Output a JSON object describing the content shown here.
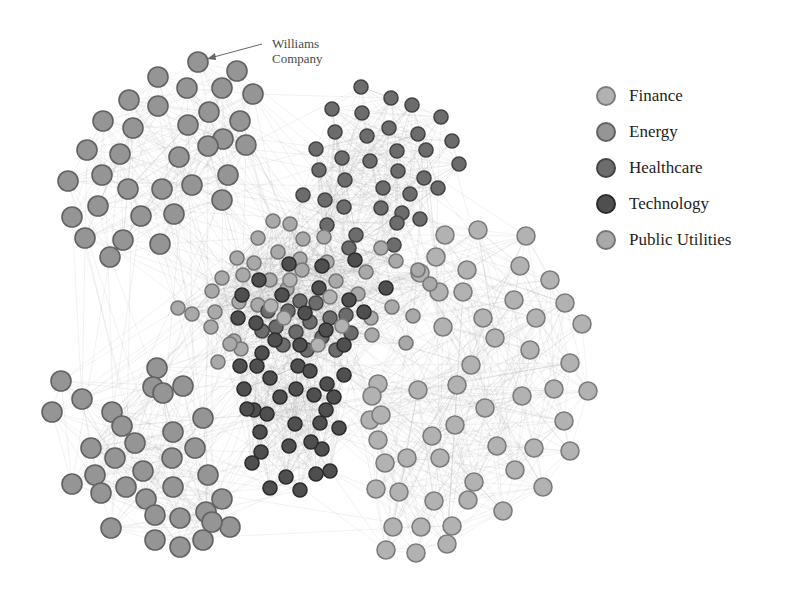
{
  "diagram": {
    "type": "network"
  },
  "annotation": {
    "line1": "Williams",
    "line2": "Company",
    "target_node": [
      198,
      62
    ],
    "arrow_from": [
      262,
      44
    ]
  },
  "legend": [
    {
      "label": "Finance",
      "color": "#b2b2b2",
      "stroke": "#7c7c7c"
    },
    {
      "label": "Energy",
      "color": "#959595",
      "stroke": "#626262"
    },
    {
      "label": "Healthcare",
      "color": "#6c6c6c",
      "stroke": "#444444"
    },
    {
      "label": "Technology",
      "color": "#4f4f4f",
      "stroke": "#2c2c2c"
    },
    {
      "label": "Public Utilities",
      "color": "#a9a9a9",
      "stroke": "#767676"
    }
  ],
  "clusters": [
    {
      "name": "Energy-top-left",
      "sector": 1,
      "r": 10,
      "nodes": [
        [
          198,
          62
        ],
        [
          237,
          71
        ],
        [
          158,
          77
        ],
        [
          253,
          94
        ],
        [
          187,
          88
        ],
        [
          222,
          88
        ],
        [
          129,
          100
        ],
        [
          158,
          106
        ],
        [
          209,
          112
        ],
        [
          240,
          121
        ],
        [
          103,
          121
        ],
        [
          133,
          128
        ],
        [
          188,
          125
        ],
        [
          223,
          139
        ],
        [
          87,
          150
        ],
        [
          120,
          154
        ],
        [
          179,
          157
        ],
        [
          208,
          146
        ],
        [
          246,
          145
        ],
        [
          68,
          181
        ],
        [
          102,
          175
        ],
        [
          128,
          189
        ],
        [
          162,
          189
        ],
        [
          192,
          185
        ],
        [
          228,
          175
        ],
        [
          72,
          217
        ],
        [
          98,
          206
        ],
        [
          141,
          216
        ],
        [
          174,
          214
        ],
        [
          222,
          200
        ],
        [
          85,
          238
        ],
        [
          123,
          240
        ],
        [
          160,
          244
        ],
        [
          110,
          257
        ]
      ]
    },
    {
      "name": "Healthcare-top",
      "sector": 2,
      "r": 7,
      "nodes": [
        [
          361,
          87
        ],
        [
          391,
          98
        ],
        [
          412,
          105
        ],
        [
          441,
          117
        ],
        [
          332,
          109
        ],
        [
          362,
          113
        ],
        [
          389,
          128
        ],
        [
          418,
          134
        ],
        [
          452,
          141
        ],
        [
          335,
          132
        ],
        [
          367,
          136
        ],
        [
          397,
          151
        ],
        [
          426,
          150
        ],
        [
          459,
          164
        ],
        [
          316,
          149
        ],
        [
          342,
          158
        ],
        [
          370,
          161
        ],
        [
          398,
          171
        ],
        [
          424,
          178
        ],
        [
          319,
          170
        ],
        [
          345,
          180
        ],
        [
          383,
          188
        ],
        [
          410,
          194
        ],
        [
          438,
          188
        ],
        [
          303,
          195
        ],
        [
          325,
          200
        ],
        [
          344,
          207
        ],
        [
          381,
          208
        ],
        [
          402,
          213
        ],
        [
          327,
          225
        ],
        [
          356,
          235
        ],
        [
          397,
          223
        ],
        [
          420,
          219
        ],
        [
          394,
          245
        ],
        [
          349,
          248
        ]
      ]
    },
    {
      "name": "Finance-right",
      "sector": 0,
      "r": 9,
      "nodes": [
        [
          445,
          235
        ],
        [
          478,
          230
        ],
        [
          526,
          236
        ],
        [
          436,
          257
        ],
        [
          420,
          273
        ],
        [
          467,
          270
        ],
        [
          520,
          266
        ],
        [
          550,
          280
        ],
        [
          439,
          292
        ],
        [
          463,
          292
        ],
        [
          514,
          300
        ],
        [
          565,
          303
        ],
        [
          483,
          318
        ],
        [
          536,
          318
        ],
        [
          582,
          324
        ],
        [
          443,
          327
        ],
        [
          495,
          338
        ],
        [
          530,
          350
        ],
        [
          570,
          363
        ],
        [
          471,
          365
        ],
        [
          554,
          389
        ],
        [
          588,
          391
        ],
        [
          457,
          385
        ],
        [
          485,
          408
        ],
        [
          522,
          396
        ],
        [
          564,
          421
        ],
        [
          570,
          451
        ],
        [
          497,
          446
        ],
        [
          534,
          448
        ],
        [
          455,
          425
        ],
        [
          440,
          458
        ],
        [
          474,
          482
        ],
        [
          515,
          470
        ],
        [
          543,
          487
        ],
        [
          407,
          458
        ],
        [
          434,
          501
        ],
        [
          468,
          500
        ],
        [
          503,
          511
        ],
        [
          447,
          544
        ],
        [
          378,
          384
        ],
        [
          418,
          390
        ],
        [
          432,
          436
        ],
        [
          385,
          463
        ],
        [
          393,
          527
        ],
        [
          421,
          527
        ],
        [
          452,
          526
        ],
        [
          416,
          553
        ],
        [
          372,
          396
        ],
        [
          370,
          420
        ],
        [
          381,
          415
        ],
        [
          378,
          440
        ],
        [
          376,
          489
        ],
        [
          399,
          492
        ],
        [
          386,
          550
        ]
      ]
    },
    {
      "name": "Energy-bottom-left",
      "sector": 1,
      "r": 10,
      "nodes": [
        [
          61,
          381
        ],
        [
          82,
          399
        ],
        [
          52,
          412
        ],
        [
          112,
          412
        ],
        [
          157,
          368
        ],
        [
          153,
          387
        ],
        [
          163,
          393
        ],
        [
          183,
          386
        ],
        [
          122,
          426
        ],
        [
          135,
          443
        ],
        [
          173,
          432
        ],
        [
          172,
          458
        ],
        [
          115,
          458
        ],
        [
          91,
          448
        ],
        [
          95,
          475
        ],
        [
          143,
          471
        ],
        [
          203,
          418
        ],
        [
          195,
          448
        ],
        [
          173,
          487
        ],
        [
          126,
          487
        ],
        [
          208,
          475
        ],
        [
          222,
          499
        ],
        [
          230,
          527
        ],
        [
          206,
          512
        ],
        [
          180,
          518
        ],
        [
          203,
          540
        ],
        [
          155,
          540
        ],
        [
          146,
          499
        ],
        [
          111,
          528
        ],
        [
          72,
          484
        ],
        [
          101,
          493
        ],
        [
          180,
          547
        ],
        [
          212,
          522
        ],
        [
          155,
          515
        ]
      ]
    },
    {
      "name": "Technology-bottom",
      "sector": 3,
      "r": 7,
      "nodes": [
        [
          240,
          366
        ],
        [
          257,
          366
        ],
        [
          244,
          389
        ],
        [
          270,
          378
        ],
        [
          298,
          366
        ],
        [
          310,
          371
        ],
        [
          344,
          375
        ],
        [
          327,
          384
        ],
        [
          296,
          389
        ],
        [
          314,
          395
        ],
        [
          334,
          397
        ],
        [
          254,
          410
        ],
        [
          280,
          397
        ],
        [
          267,
          414
        ],
        [
          247,
          409
        ],
        [
          260,
          432
        ],
        [
          295,
          424
        ],
        [
          320,
          423
        ],
        [
          326,
          410
        ],
        [
          339,
          428
        ],
        [
          322,
          449
        ],
        [
          261,
          452
        ],
        [
          289,
          446
        ],
        [
          311,
          442
        ],
        [
          252,
          463
        ],
        [
          330,
          471
        ],
        [
          286,
          477
        ],
        [
          270,
          488
        ],
        [
          300,
          490
        ],
        [
          316,
          474
        ]
      ]
    },
    {
      "name": "PublicUtilities-center",
      "sector": 4,
      "r": 7,
      "nodes": [
        [
          273,
          221
        ],
        [
          290,
          224
        ],
        [
          303,
          239
        ],
        [
          258,
          238
        ],
        [
          278,
          252
        ],
        [
          300,
          259
        ],
        [
          324,
          237
        ],
        [
          254,
          263
        ],
        [
          237,
          258
        ],
        [
          222,
          278
        ],
        [
          243,
          275
        ],
        [
          270,
          280
        ],
        [
          287,
          289
        ],
        [
          302,
          270
        ],
        [
          327,
          262
        ],
        [
          336,
          281
        ],
        [
          212,
          291
        ],
        [
          239,
          302
        ],
        [
          258,
          305
        ],
        [
          366,
          272
        ],
        [
          358,
          294
        ],
        [
          381,
          248
        ],
        [
          396,
          261
        ],
        [
          418,
          270
        ],
        [
          430,
          284
        ],
        [
          413,
          316
        ],
        [
          392,
          307
        ],
        [
          371,
          318
        ],
        [
          406,
          343
        ],
        [
          372,
          335
        ],
        [
          215,
          312
        ],
        [
          192,
          314
        ],
        [
          178,
          308
        ],
        [
          211,
          327
        ],
        [
          234,
          341
        ],
        [
          241,
          349
        ],
        [
          218,
          362
        ],
        [
          230,
          344
        ]
      ]
    },
    {
      "name": "Mixed-core",
      "sector": 2,
      "r": 7,
      "nodes": [
        [
          288,
          311
        ],
        [
          300,
          301
        ],
        [
          316,
          303
        ],
        [
          330,
          318
        ],
        [
          310,
          322
        ],
        [
          296,
          332
        ],
        [
          276,
          327
        ],
        [
          322,
          337
        ],
        [
          336,
          350
        ],
        [
          307,
          350
        ],
        [
          283,
          345
        ],
        [
          268,
          311
        ],
        [
          262,
          331
        ],
        [
          346,
          315
        ],
        [
          351,
          333
        ]
      ]
    },
    {
      "name": "Technology-core",
      "sector": 3,
      "r": 7,
      "nodes": [
        [
          259,
          280
        ],
        [
          242,
          295
        ],
        [
          282,
          295
        ],
        [
          319,
          288
        ],
        [
          305,
          313
        ],
        [
          275,
          340
        ],
        [
          300,
          345
        ],
        [
          326,
          330
        ],
        [
          349,
          300
        ],
        [
          364,
          312
        ],
        [
          238,
          318
        ],
        [
          262,
          353
        ],
        [
          386,
          288
        ],
        [
          322,
          266
        ],
        [
          355,
          260
        ],
        [
          289,
          264
        ],
        [
          256,
          323
        ],
        [
          344,
          345
        ]
      ]
    },
    {
      "name": "Finance-core",
      "sector": 0,
      "r": 7,
      "nodes": [
        [
          290,
          280
        ],
        [
          330,
          297
        ],
        [
          284,
          318
        ],
        [
          318,
          345
        ],
        [
          271,
          306
        ],
        [
          342,
          326
        ]
      ]
    }
  ],
  "edge_style": {
    "color": "#9a9a9a",
    "opacity": 0.22
  }
}
